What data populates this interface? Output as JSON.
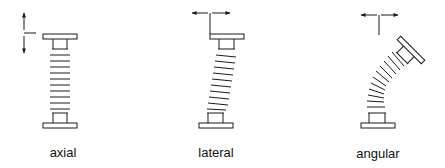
{
  "diagram": {
    "type": "bellows-movement-types",
    "figures": [
      {
        "id": "axial",
        "label": "axial",
        "movement": "vertical double arrow (compression/extension)"
      },
      {
        "id": "lateral",
        "label": "lateral",
        "movement": "horizontal double arrow (side offset)"
      },
      {
        "id": "angular",
        "label": "angular",
        "movement": "horizontal double arrow (bending)"
      }
    ],
    "colors": {
      "line": "#1a1a1a",
      "background": "#ffffff"
    }
  }
}
